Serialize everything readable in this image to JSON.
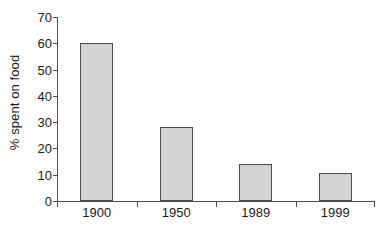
{
  "chart_data": {
    "type": "bar",
    "title": "",
    "xlabel": "",
    "ylabel": "% spent on food",
    "categories": [
      "1900",
      "1950",
      "1989",
      "1999"
    ],
    "values": [
      60,
      28,
      14,
      10.5
    ],
    "ylim": [
      0,
      70
    ],
    "yticks": [
      0,
      10,
      20,
      30,
      40,
      50,
      60,
      70
    ],
    "ytick_labels": [
      "0",
      "10",
      "20",
      "30",
      "40",
      "50",
      "60",
      "70"
    ],
    "grid": false,
    "legend": null,
    "series": [
      {
        "name": "% spent on food",
        "values": [
          60,
          28,
          14,
          10.5
        ]
      }
    ],
    "colors": {
      "bar_fill": "#d3d3d3",
      "bar_border": "#4a4a4a",
      "axis": "#4d4d4d",
      "text": "#1a1a1a",
      "background": "#ffffff"
    }
  }
}
